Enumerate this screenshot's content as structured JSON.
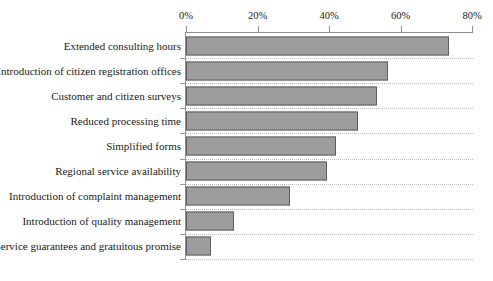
{
  "chart_data": {
    "type": "bar",
    "orientation": "horizontal",
    "title": "",
    "xlabel": "",
    "ylabel": "",
    "xlim": [
      0,
      80
    ],
    "grid": true,
    "legend": "none",
    "axis_position": "top",
    "tick_labels": [
      "0%",
      "20%",
      "40%",
      "60%",
      "80%"
    ],
    "ticks": [
      0,
      20,
      40,
      60,
      80
    ],
    "categories": [
      "Extended consulting hours",
      "Introduction of citizen registration offices",
      "Customer and citizen surveys",
      "Reduced processing time",
      "Simplified forms",
      "Regional service availability",
      "Introduction of complaint management",
      "Introduction of quality management",
      "Service guarantees and gratuitous promise"
    ],
    "values": [
      73.5,
      56.5,
      53.5,
      48,
      42,
      39.5,
      29,
      13.5,
      7
    ],
    "bar_color": "#9d9d9d",
    "bar_border_color": "#5d5d5d",
    "axis_color": "#8d8d8d",
    "grid_color": "#b9b9b9"
  }
}
